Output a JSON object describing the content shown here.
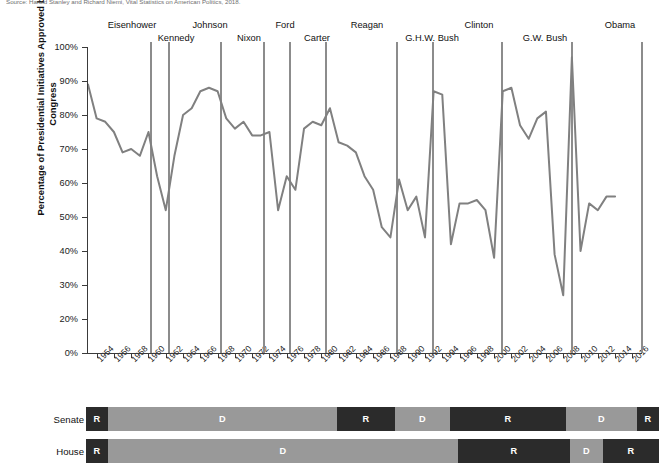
{
  "caption": "Source: Harold Stanley and Richard Niemi, Vital Statistics on American Politics, 2018.",
  "chart_data": {
    "type": "line",
    "title": "",
    "xlabel": "",
    "ylabel": "Percentage of Presidential Initiatives Approved by Congress",
    "xlim": [
      1953,
      2017
    ],
    "ylim": [
      0,
      100
    ],
    "grid": false,
    "legend": "none",
    "ytick_labels": [
      "100%",
      "90%",
      "80%",
      "70%",
      "60%",
      "50%",
      "40%",
      "30%",
      "20%",
      "0%"
    ],
    "ytick_values": [
      100,
      90,
      80,
      70,
      60,
      50,
      40,
      30,
      20,
      0
    ],
    "xtick_labels": [
      "1954",
      "1956",
      "1958",
      "1960",
      "1962",
      "1964",
      "1966",
      "1968",
      "1970",
      "1972",
      "1974",
      "1976",
      "1978",
      "1980",
      "1982",
      "1984",
      "1986",
      "1988",
      "1990",
      "1992",
      "1994",
      "1996",
      "1998",
      "2000",
      "2002",
      "2004",
      "2006",
      "2008",
      "2010",
      "2012",
      "2014",
      "2016"
    ],
    "x": [
      1953,
      1954,
      1955,
      1956,
      1957,
      1958,
      1959,
      1960,
      1961,
      1962,
      1963,
      1964,
      1965,
      1966,
      1967,
      1968,
      1969,
      1970,
      1971,
      1972,
      1973,
      1974,
      1975,
      1976,
      1977,
      1978,
      1979,
      1980,
      1981,
      1982,
      1983,
      1984,
      1985,
      1986,
      1987,
      1988,
      1989,
      1990,
      1991,
      1992,
      1993,
      1994,
      1995,
      1996,
      1997,
      1998,
      1999,
      2000,
      2001,
      2002,
      2003,
      2004,
      2005,
      2006,
      2007,
      2008,
      2009,
      2010,
      2011,
      2012,
      2013,
      2014
    ],
    "values": [
      89,
      79,
      78,
      75,
      69,
      70,
      68,
      75,
      62,
      52,
      68,
      80,
      82,
      87,
      88,
      87,
      79,
      76,
      78,
      74,
      74,
      75,
      52,
      62,
      58,
      76,
      78,
      77,
      82,
      72,
      71,
      69,
      62,
      58,
      47,
      44,
      61,
      52,
      56,
      44,
      87,
      86,
      42,
      54,
      54,
      55,
      52,
      38,
      87,
      88,
      77,
      73,
      79,
      81,
      39,
      27,
      97,
      40,
      54,
      52,
      56,
      56
    ],
    "annotations": [
      {
        "label": "Eisenhower",
        "x": 1961
      },
      {
        "label": "Kennedy",
        "x": 1963
      },
      {
        "label": "Johnson",
        "x": 1969
      },
      {
        "label": "Nixon",
        "x": 1974
      },
      {
        "label": "Ford",
        "x": 1977
      },
      {
        "label": "Carter",
        "x": 1981
      },
      {
        "label": "Reagan",
        "x": 1989
      },
      {
        "label": "G.H.W. Bush",
        "x": 1993
      },
      {
        "label": "Clinton",
        "x": 2001
      },
      {
        "label": "G.W. Bush",
        "x": 2009
      },
      {
        "label": "Obama",
        "x": 2017
      }
    ]
  },
  "presidents": [
    {
      "name": "Eisenhower",
      "label_x": 132,
      "label_y": 20,
      "line_x": 150
    },
    {
      "name": "Kennedy",
      "label_x": 176,
      "label_y": 33,
      "line_x": 168
    },
    {
      "name": "Johnson",
      "label_x": 210,
      "label_y": 20,
      "line_x": 220
    },
    {
      "name": "Nixon",
      "label_x": 249,
      "label_y": 33,
      "line_x": 263
    },
    {
      "name": "Ford",
      "label_x": 285,
      "label_y": 20,
      "line_x": 289
    },
    {
      "name": "Carter",
      "label_x": 317,
      "label_y": 33,
      "line_x": 325
    },
    {
      "name": "Reagan",
      "label_x": 367,
      "label_y": 20,
      "line_x": 396
    },
    {
      "name": "G.H.W. Bush",
      "label_x": 432,
      "label_y": 33,
      "line_x": 432
    },
    {
      "name": "Clinton",
      "label_x": 479,
      "label_y": 20,
      "line_x": 501
    },
    {
      "name": "G.W. Bush",
      "label_x": 545,
      "label_y": 33,
      "line_x": 571
    },
    {
      "name": "Obama",
      "label_x": 620,
      "label_y": 20,
      "line_x": 641
    }
  ],
  "congress": {
    "rows": [
      {
        "label": "Senate",
        "segments": [
          {
            "party": "R",
            "start": 86,
            "end": 108
          },
          {
            "party": "D",
            "start": 108,
            "end": 337
          },
          {
            "party": "R",
            "start": 337,
            "end": 395
          },
          {
            "party": "D",
            "start": 395,
            "end": 450
          },
          {
            "party": "R",
            "start": 450,
            "end": 566
          },
          {
            "party": "D",
            "start": 566,
            "end": 637
          },
          {
            "party": "R",
            "start": 637,
            "end": 659
          }
        ]
      },
      {
        "label": "House",
        "segments": [
          {
            "party": "R",
            "start": 86,
            "end": 108
          },
          {
            "party": "D",
            "start": 108,
            "end": 458
          },
          {
            "party": "R",
            "start": 458,
            "end": 570
          },
          {
            "party": "D",
            "start": 570,
            "end": 603
          },
          {
            "party": "R",
            "start": 603,
            "end": 659
          }
        ]
      }
    ],
    "party_labels": {
      "R": "R",
      "D": "D"
    }
  },
  "colors": {
    "line": "#808080",
    "republican": "#2b2b2b",
    "democrat": "#999999",
    "divider": "#8c8c8c",
    "axis": "#3a3a3a"
  }
}
